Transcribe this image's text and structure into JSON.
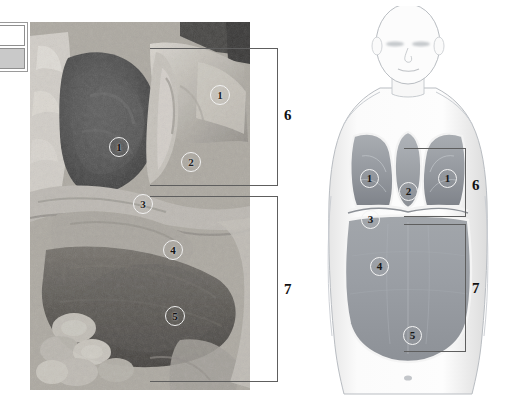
{
  "figure": {
    "background_color": "#ffffff",
    "width": 513,
    "height": 412
  },
  "legend_box": {
    "name": "two-cell-swatch",
    "cells": [
      {
        "label": "",
        "fill": "#ffffff"
      },
      {
        "label": "",
        "fill": "#c9c9c9"
      }
    ]
  },
  "photograph": {
    "name": "cadaver-dissection-photo",
    "type": "grayscale-anatomical-photograph",
    "labels": [
      {
        "id": "p1a",
        "text": "1",
        "x": 190,
        "y": 73
      },
      {
        "id": "p1b",
        "text": "1",
        "x": 89,
        "y": 125
      },
      {
        "id": "p2",
        "text": "2",
        "x": 161,
        "y": 140
      },
      {
        "id": "p3",
        "text": "3",
        "x": 113,
        "y": 182
      },
      {
        "id": "p4",
        "text": "4",
        "x": 143,
        "y": 228
      },
      {
        "id": "p5",
        "text": "5",
        "x": 145,
        "y": 294
      }
    ]
  },
  "photo_brackets": [
    {
      "id": "pb6",
      "text": "6",
      "region": "thorax"
    },
    {
      "id": "pb7",
      "text": "7",
      "region": "abdomen"
    }
  ],
  "schematic": {
    "name": "body-outline-diagram",
    "type": "line-drawing-human-torso",
    "labels": [
      {
        "id": "s1a",
        "text": "1",
        "organ": "lung-right"
      },
      {
        "id": "s2",
        "text": "2",
        "organ": "heart-mediastinum"
      },
      {
        "id": "s1b",
        "text": "1",
        "organ": "lung-left"
      },
      {
        "id": "s3",
        "text": "3",
        "organ": "diaphragm"
      },
      {
        "id": "s4",
        "text": "4",
        "organ": "abdominal-cavity"
      },
      {
        "id": "s5",
        "text": "5",
        "organ": "pelvic-cavity"
      }
    ],
    "brackets": [
      {
        "id": "sb6",
        "text": "6",
        "region": "thorax"
      },
      {
        "id": "sb7",
        "text": "7",
        "region": "abdomen"
      }
    ]
  },
  "colors": {
    "bracket_line": "#5e5e5e",
    "label_ring": "#f2f2f2",
    "label_text": "#1d1d1d",
    "outline": "#9aa0a6",
    "organ_fill": "#9fa3a8",
    "body_fill": "#fbfbfb"
  }
}
